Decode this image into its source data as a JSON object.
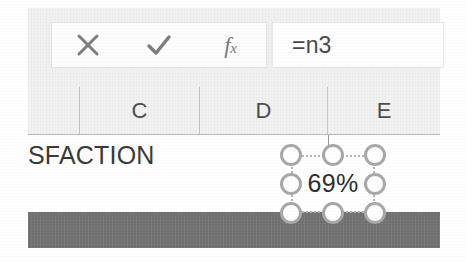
{
  "app": {
    "name": "spreadsheet",
    "window_title": "Spreadsheet formula bar and selected cell"
  },
  "formula_bar": {
    "cancel_label": "×",
    "cancel_icon": "close-x-icon",
    "confirm_label": "✓",
    "confirm_icon": "checkmark-icon",
    "function_label": "f",
    "function_label_sub": "x",
    "function_icon": "insert-function-fx-icon",
    "value": "=n3",
    "placeholder": ""
  },
  "grid": {
    "column_headers": [
      {
        "label": "",
        "name": "column-header-partial"
      },
      {
        "label": "C",
        "name": "column-header-c"
      },
      {
        "label": "D",
        "name": "column-header-d"
      },
      {
        "label": "E",
        "name": "column-header-e"
      }
    ],
    "cell_text": "SFACTION",
    "selected_value": "69%"
  },
  "selection": {
    "handles": [
      "resize-handle-nw",
      "resize-handle-n",
      "resize-handle-ne",
      "resize-handle-w",
      "resize-handle-e",
      "resize-handle-sw",
      "resize-handle-s",
      "resize-handle-se"
    ]
  },
  "colors": {
    "ribbon_bg": "#f1f1f1",
    "header_bg": "#f2f2f2",
    "grid_bg": "#ffffff",
    "dark_band": "#6f6f6f",
    "handle_stroke": "#a8a8a8",
    "text": "#3a3a3a",
    "icon": "#7d7d7d"
  }
}
